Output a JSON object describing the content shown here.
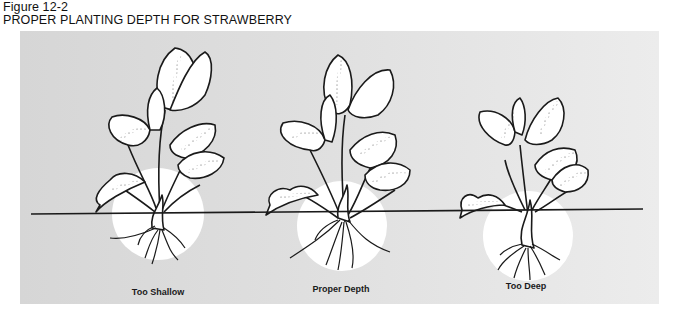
{
  "figure": {
    "label": "Figure 12-2",
    "title": "PROPER PLANTING DEPTH FOR STRAWBERRY"
  },
  "colors": {
    "panel_bg": "#dcdcdc",
    "line": "#1a1a1a",
    "crown_highlight": "#ffffff"
  },
  "ground_line": {
    "x1": 31,
    "y1": 214,
    "x2": 643,
    "y2": 209
  },
  "plants": [
    {
      "id": "too-shallow",
      "caption": "Too Shallow",
      "crown_center": [
        158,
        214
      ],
      "crown_radius": 46,
      "caption_x": 158,
      "caption_y": 292
    },
    {
      "id": "proper-depth",
      "caption": "Proper Depth",
      "crown_center": [
        342,
        226
      ],
      "crown_radius": 45,
      "caption_x": 341,
      "caption_y": 289
    },
    {
      "id": "too-deep",
      "caption": "Too Deep",
      "crown_center": [
        528,
        236
      ],
      "crown_radius": 45,
      "caption_x": 526,
      "caption_y": 286
    }
  ]
}
